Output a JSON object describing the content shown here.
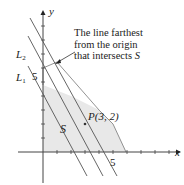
{
  "diagram": {
    "axes": {
      "x_label": "x",
      "y_label": "y",
      "x_tick_label": "5",
      "y_tick_label": "5"
    },
    "lines": [
      {
        "name": "L1",
        "label_main": "L",
        "label_sub": "1"
      },
      {
        "name": "L2",
        "label_main": "L",
        "label_sub": "2"
      }
    ],
    "region_label": "S",
    "point_label": "P(3, 2)",
    "annotation": {
      "line1": "The line farthest",
      "line2": "from the origin",
      "line3_prefix": "that intersects ",
      "line3_var": "S"
    },
    "colors": {
      "region_fill": "#e6e6e6",
      "line": "#555555",
      "axis": "#444444"
    }
  }
}
